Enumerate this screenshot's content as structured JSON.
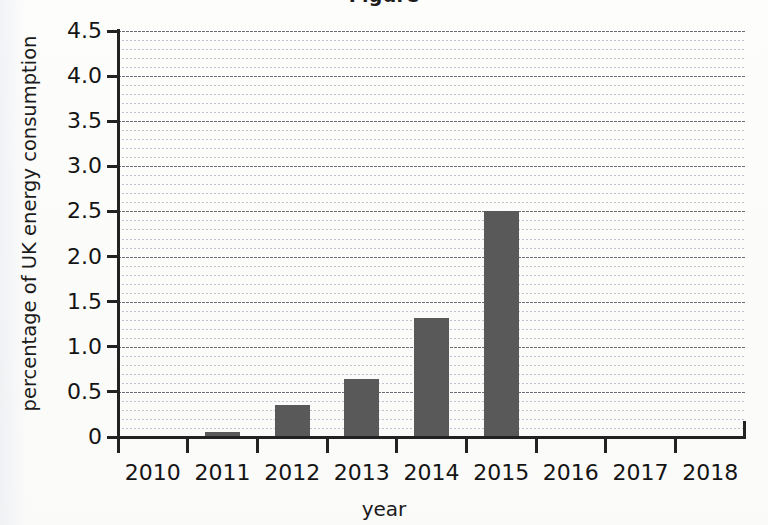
{
  "chart_data": {
    "type": "bar",
    "title": "",
    "xlabel": "year",
    "ylabel": "percentage of UK energy consumption",
    "categories": [
      "2010",
      "2011",
      "2012",
      "2013",
      "2014",
      "2015",
      "2016",
      "2017",
      "2018"
    ],
    "values": [
      0,
      0.06,
      0.36,
      0.64,
      1.32,
      2.5,
      0,
      0,
      0
    ],
    "ylim": [
      0,
      4.5
    ],
    "y_ticks": [
      0,
      0.5,
      1.0,
      1.5,
      2.0,
      2.5,
      3.0,
      3.5,
      4.0,
      4.5
    ],
    "y_tick_labels": [
      "0",
      "0.5",
      "1.0",
      "1.5",
      "2.0",
      "2.5",
      "3.0",
      "3.5",
      "4.0",
      "4.5"
    ],
    "minor_tick_step": 0.1,
    "grid": true,
    "grid_major_step": 0.5,
    "legend": null,
    "bar_color": "#595959",
    "grid_major_color": "#63666e",
    "grid_minor_color": "#9aa6bb",
    "axis_color": "#222222"
  },
  "figure": {
    "background_color": "#fdfdfc",
    "cropped_title_fragment": "Figure"
  }
}
